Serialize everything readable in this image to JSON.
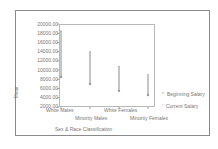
{
  "chart_data": {
    "type": "line",
    "subtype": "high-low / range chart",
    "title": "",
    "xlabel": "Sex & Race Classification",
    "ylabel": "Mean",
    "categories": [
      "White Males",
      "Minority Males",
      "White Females",
      "Minority Females"
    ],
    "series": [
      {
        "name": "Beginning Salary",
        "values": [
          8500,
          7000,
          5500,
          4600
        ]
      },
      {
        "name": "Current Salary",
        "values": [
          18500,
          14000,
          10800,
          9000
        ]
      }
    ],
    "ylim": [
      2000,
      20000
    ],
    "yticks": [
      "20000.00",
      "18000.00",
      "16000.00",
      "14000.00",
      "12000.00",
      "10000.00",
      "8000.00",
      "6000.00",
      "4000.00",
      "2000.00"
    ],
    "grid": false,
    "legend_position": "right"
  },
  "axis": {
    "ylabel": "Mean",
    "xtitle": "Sex & Race Classification",
    "yticks": [
      {
        "label": "20000.00",
        "value": 20000
      },
      {
        "label": "18000.00",
        "value": 18000
      },
      {
        "label": "16000.00",
        "value": 16000
      },
      {
        "label": "14000.00",
        "value": 14000
      },
      {
        "label": "12000.00",
        "value": 12000
      },
      {
        "label": "10000.00",
        "value": 10000
      },
      {
        "label": "8000.00",
        "value": 8000
      },
      {
        "label": "6000.00",
        "value": 6000
      },
      {
        "label": "4000.00",
        "value": 4000
      },
      {
        "label": "2000.00",
        "value": 2000
      }
    ],
    "xcats": [
      "White Males",
      "Minority Males",
      "White Females",
      "Minority Females"
    ]
  },
  "legend": {
    "items": [
      {
        "label": "Beginning Salary",
        "marker": "*"
      },
      {
        "label": "Current Salary",
        "marker": "'"
      }
    ]
  },
  "colors": {
    "line": "#8c8c8c",
    "text": "#777777",
    "frame": "#8a8a8a"
  }
}
